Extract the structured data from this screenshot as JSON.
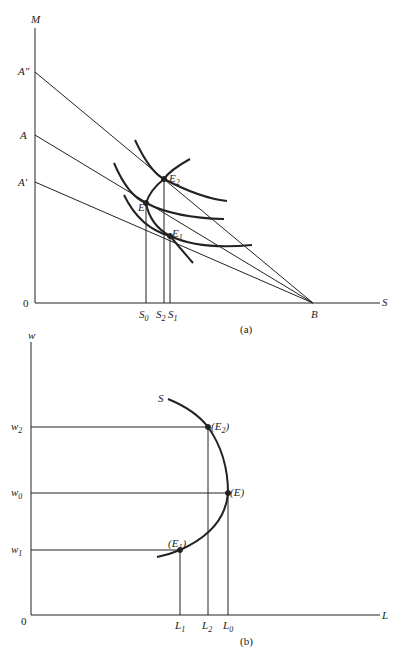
{
  "panel_a": {
    "caption": "(a)",
    "y_axis_label": "M",
    "x_axis_label": "S",
    "origin_label": "0",
    "intercepts_y": [
      "A\"",
      "A",
      "A'"
    ],
    "intercept_x": "B",
    "points": [
      "E2",
      "E",
      "E1"
    ],
    "x_ticks": [
      "S0",
      "S2",
      "S1"
    ]
  },
  "panel_b": {
    "caption": "(b)",
    "y_axis_label": "w",
    "x_axis_label": "L",
    "origin_label": "0",
    "curve_label": "S",
    "y_ticks": [
      "w2",
      "w0",
      "w1"
    ],
    "x_ticks": [
      "L1",
      "L2",
      "L0"
    ],
    "points": [
      "(E2)",
      "(E)",
      "(E1)"
    ]
  },
  "labels": {
    "M": "M",
    "S_axis": "S",
    "zero_a": "0",
    "A2": "A\"",
    "A": "A",
    "A1": "A'",
    "B": "B",
    "E2": "E",
    "E2_sub": "2",
    "E": "E",
    "E1": "E",
    "E1_sub": "1",
    "S0": "S",
    "S0_sub": "0",
    "S2": "S",
    "S2_sub": "2",
    "S1": "S",
    "S1_sub": "1",
    "cap_a": "(a)",
    "w": "w",
    "L_axis": "L",
    "zero_b": "0",
    "S_curve": "S",
    "w2": "w",
    "w2_sub": "2",
    "w0": "w",
    "w0_sub": "0",
    "w1": "w",
    "w1_sub": "1",
    "pE2": "(E",
    "pE2_sub": "2",
    "pE2_close": ")",
    "pE": "(E)",
    "pE1": "(E",
    "pE1_sub": "1",
    "pE1_close": ")",
    "L1": "L",
    "L1_sub": "1",
    "L2": "L",
    "L2_sub": "2",
    "L0": "L",
    "L0_sub": "0",
    "cap_b": "(b)"
  }
}
